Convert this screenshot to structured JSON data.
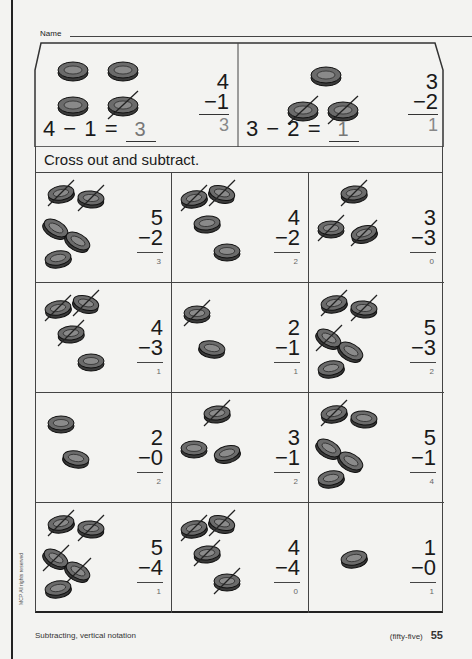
{
  "header": {
    "name_label": "Name"
  },
  "examples": [
    {
      "equation_left": "4 − 1 =",
      "answer": "3",
      "top": "4",
      "sub": "−1",
      "result": "3",
      "coins_total": 4,
      "crossed": 1
    },
    {
      "equation_left": "3 − 2 =",
      "answer": "1",
      "top": "3",
      "sub": "−2",
      "result": "1",
      "coins_total": 3,
      "crossed": 2
    }
  ],
  "instruction": "Cross out and subtract.",
  "problems": [
    {
      "top": "5",
      "sub": "−2",
      "answer": "3",
      "coins": 5,
      "crossed": 2
    },
    {
      "top": "4",
      "sub": "−2",
      "answer": "2",
      "coins": 4,
      "crossed": 2
    },
    {
      "top": "3",
      "sub": "−3",
      "answer": "0",
      "coins": 3,
      "crossed": 3
    },
    {
      "top": "4",
      "sub": "−3",
      "answer": "1",
      "coins": 4,
      "crossed": 3
    },
    {
      "top": "2",
      "sub": "−1",
      "answer": "1",
      "coins": 2,
      "crossed": 1
    },
    {
      "top": "5",
      "sub": "−3",
      "answer": "2",
      "coins": 5,
      "crossed": 3
    },
    {
      "top": "2",
      "sub": "−0",
      "answer": "2",
      "coins": 2,
      "crossed": 0
    },
    {
      "top": "3",
      "sub": "−1",
      "answer": "2",
      "coins": 3,
      "crossed": 1
    },
    {
      "top": "5",
      "sub": "−1",
      "answer": "4",
      "coins": 5,
      "crossed": 1
    },
    {
      "top": "5",
      "sub": "−4",
      "answer": "1",
      "coins": 5,
      "crossed": 4
    },
    {
      "top": "4",
      "sub": "−4",
      "answer": "0",
      "coins": 4,
      "crossed": 4
    },
    {
      "top": "1",
      "sub": "−0",
      "answer": "1",
      "coins": 1,
      "crossed": 0
    }
  ],
  "footer": {
    "topic": "Subtracting, vertical notation",
    "page_words": "(fifty-five)",
    "page_number": "55",
    "copyright": "MCP All rights reserved"
  }
}
